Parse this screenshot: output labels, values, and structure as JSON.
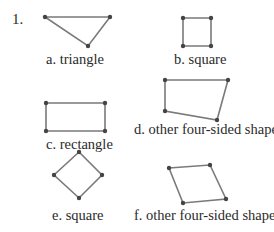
{
  "problem_number": "1.",
  "colors": {
    "stroke": "#7a7a7a",
    "vertex": "#444444",
    "text": "#2a2a2a"
  },
  "shapes": [
    {
      "id": "a",
      "label": "a. triangle",
      "points": [
        [
          45,
          17
        ],
        [
          110,
          17
        ],
        [
          88,
          46
        ]
      ]
    },
    {
      "id": "b",
      "label": "b. square",
      "points": [
        [
          183,
          18
        ],
        [
          211,
          18
        ],
        [
          211,
          46
        ],
        [
          183,
          46
        ]
      ]
    },
    {
      "id": "c",
      "label": "c. rectangle",
      "points": [
        [
          46,
          103
        ],
        [
          105,
          103
        ],
        [
          105,
          131
        ],
        [
          46,
          131
        ]
      ]
    },
    {
      "id": "d",
      "label": "d. other four-sided shape",
      "points": [
        [
          165,
          80
        ],
        [
          228,
          80
        ],
        [
          217,
          120
        ],
        [
          165,
          111
        ]
      ]
    },
    {
      "id": "e",
      "label": "e. square",
      "points": [
        [
          79,
          152
        ],
        [
          102,
          175
        ],
        [
          79,
          198
        ],
        [
          54,
          175
        ]
      ]
    },
    {
      "id": "f",
      "label": "f. other four-sided shape",
      "points": [
        [
          169,
          168
        ],
        [
          210,
          165
        ],
        [
          226,
          199
        ],
        [
          183,
          203
        ]
      ]
    }
  ]
}
